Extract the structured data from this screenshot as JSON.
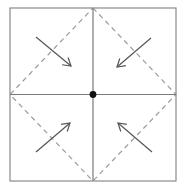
{
  "figure": {
    "name": "symmetry-diagram-square-inward-arrows",
    "canvas": {
      "width": 185,
      "height": 187,
      "background": "#ffffff"
    },
    "square": {
      "label": "outer-square",
      "x": 10,
      "y": 8,
      "width": 166,
      "height": 173,
      "stroke": "#8a8a8a",
      "stroke_width": 1.2,
      "fill": "none"
    },
    "axes": {
      "label": "center-cross",
      "stroke": "#7b7b7b",
      "stroke_width": 1.2,
      "horizontal": {
        "x1": 10,
        "y1": 94.5,
        "x2": 176,
        "y2": 94.5
      },
      "vertical": {
        "x1": 93,
        "y1": 8,
        "x2": 93,
        "y2": 181
      }
    },
    "center_point": {
      "label": "center-dot",
      "cx": 93,
      "cy": 94.5,
      "r": 3.4,
      "fill": "#111111"
    },
    "diamond": {
      "label": "dashed-diamond",
      "stroke": "#9a9a9a",
      "stroke_width": 1.2,
      "dash_pattern": "5 4",
      "vertices": [
        {
          "name": "top-midpoint",
          "x": 93,
          "y": 8
        },
        {
          "name": "right-midpoint",
          "x": 176,
          "y": 94.5
        },
        {
          "name": "bottom-midpoint",
          "x": 93,
          "y": 181
        },
        {
          "name": "left-midpoint",
          "x": 10,
          "y": 94.5
        }
      ]
    },
    "arrows": {
      "stroke": "#555555",
      "stroke_width": 1.2,
      "head_length": 9,
      "items": [
        {
          "name": "arrow-top-left-quadrant",
          "quadrant": "top-left",
          "direction": "down-right",
          "tail": {
            "x": 36,
            "y": 37
          },
          "tip": {
            "x": 71,
            "y": 66
          }
        },
        {
          "name": "arrow-top-right-quadrant",
          "quadrant": "top-right",
          "direction": "down-left",
          "tail": {
            "x": 151,
            "y": 38
          },
          "tip": {
            "x": 117,
            "y": 67
          }
        },
        {
          "name": "arrow-bottom-left-quadrant",
          "quadrant": "bottom-left",
          "direction": "up-right",
          "tail": {
            "x": 36,
            "y": 152
          },
          "tip": {
            "x": 70,
            "y": 123
          }
        },
        {
          "name": "arrow-bottom-right-quadrant",
          "quadrant": "bottom-right",
          "direction": "up-left",
          "tail": {
            "x": 152,
            "y": 152
          },
          "tip": {
            "x": 118,
            "y": 123
          }
        }
      ]
    }
  }
}
